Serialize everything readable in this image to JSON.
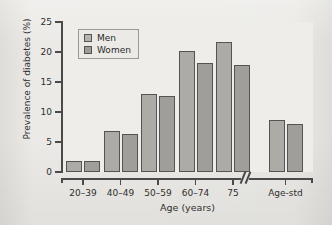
{
  "figure": {
    "background_color": "#e8e7e3",
    "plot_background_color": "#eeede9",
    "axis_color": "#4a4a4a",
    "axis_break_marker": "//"
  },
  "chart_data": {
    "type": "bar",
    "title": "",
    "subtitle": "",
    "xlabel": "Age (years)",
    "ylabel": "Prevalence of diabetes (%)",
    "categories": [
      "20–39",
      "40–49",
      "50–59",
      "60–74",
      "75",
      "Age-std"
    ],
    "series": [
      {
        "name": "Men",
        "color": "#adaba6",
        "values": [
          1.8,
          6.9,
          13.0,
          20.1,
          21.6,
          8.7
        ]
      },
      {
        "name": "Women",
        "color": "#a09e99",
        "values": [
          1.8,
          6.4,
          12.7,
          18.2,
          17.8,
          8.0
        ]
      }
    ],
    "ylim": [
      0,
      25
    ],
    "yticks": [
      0,
      5,
      10,
      15,
      20,
      25
    ],
    "ytick_labels": [
      "0",
      "5",
      "10",
      "15",
      "20",
      "25"
    ],
    "grid": false,
    "legend_position": "upper left",
    "axis_break": {
      "present": true,
      "between": [
        "75",
        "Age-std"
      ]
    }
  },
  "legend": {
    "entries": [
      {
        "label": "Men"
      },
      {
        "label": "Women"
      }
    ]
  }
}
